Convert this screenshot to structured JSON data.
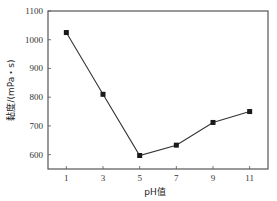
{
  "chart_data": {
    "type": "line",
    "title": "",
    "xlabel": "pH值",
    "ylabel": "黏度/(mPa・s)",
    "x": [
      1,
      3,
      5,
      7,
      9,
      11
    ],
    "categories": [
      "1",
      "3",
      "5",
      "7",
      "9",
      "11"
    ],
    "series": [
      {
        "name": "黏度",
        "values": [
          1025,
          810,
          597,
          633,
          712,
          750
        ],
        "marker": "square",
        "color": "#1a1a1a"
      }
    ],
    "ylim": [
      550,
      1100
    ],
    "yticks": [
      600,
      700,
      800,
      900,
      1000,
      1100
    ],
    "xlim": [
      0,
      12
    ],
    "xticks": [
      1,
      3,
      5,
      7,
      9,
      11
    ],
    "grid": false,
    "legend": null
  }
}
